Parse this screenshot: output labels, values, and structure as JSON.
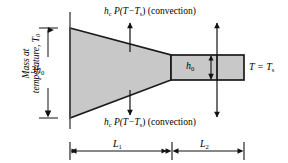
{
  "figure": {
    "background_color": "#ffffff",
    "body_fill_color": "#c8c8c8",
    "outline_color": "#1a1a1a"
  },
  "labels": {
    "side_caption_line1": "Mass at",
    "side_caption_line2": "temperature, ",
    "side_caption_symbol": "T",
    "side_caption_subscript": "0",
    "base_height": "3h",
    "base_height_subscript": "0",
    "tip_height": "h",
    "tip_height_subscript": "0",
    "surface_temp": "T = T",
    "surface_temp_subscript": "s",
    "convection_top": "h",
    "convection_top_sub": "c",
    "convection_expr": " P(T−T",
    "convection_expr_sub": "s",
    "convection_expr_tail": ") (convection)",
    "convection_bottom": "h",
    "convection_bottom_sub": "c",
    "length_1": "L",
    "length_1_subscript": "1",
    "length_2": "L",
    "length_2_subscript": "2"
  },
  "geometry": {
    "wall_x": 70,
    "wall_top_y": 12,
    "wall_bottom_y": 129,
    "trapezoid_points": "70,28 171,55 171,80 70,118",
    "rect_x": 171,
    "rect_y": 55,
    "rect_width": 73,
    "rect_height": 25,
    "dim_line_y": 151,
    "tick_left_x": 70,
    "tick_mid_x": 172,
    "tick_right_x": 244,
    "conv_arrow_left_x": 130,
    "conv_arrow_right_x": 217,
    "h0_arrow_x": 211,
    "dim_height_x": 48
  }
}
